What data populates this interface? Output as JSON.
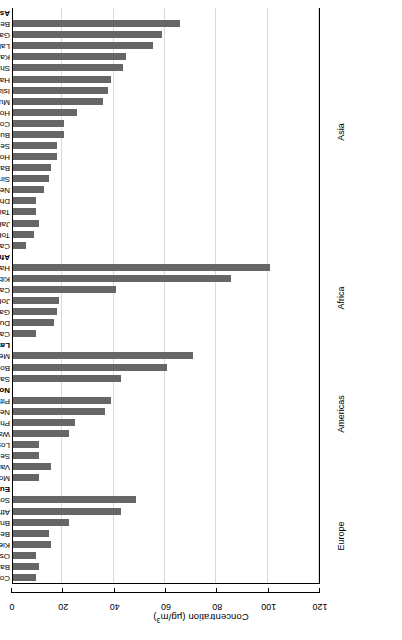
{
  "chart_data": {
    "type": "bar",
    "orientation": "horizontal",
    "title": "",
    "xlabel": "Concentration (µg/m³)",
    "ylabel": "",
    "xlim": [
      0,
      120
    ],
    "xticks": [
      0,
      20,
      40,
      60,
      80,
      100,
      120
    ],
    "xtick_labels": [
      "0",
      "20",
      "40",
      "60",
      "80",
      "100",
      "120"
    ],
    "grid": "vertical",
    "legend": "none",
    "bar_color": "#666666",
    "axis_color": "#000000",
    "gridline_color": "#d9d9d9",
    "rotated_180": true,
    "categories": [
      "Asia",
      "Beijing",
      "Gangzhou",
      "Lahore",
      "Karachi",
      "Shanghai",
      "Hanoi",
      "Islamabad",
      "Mumbai",
      "Ho Chi Minh City",
      "Colombo",
      "Busan",
      "Seoul",
      "Hong Kong",
      "Bangkok",
      "Singapore",
      "New Delhi",
      "Dhaka",
      "Taipei",
      "Jakarta",
      "Tokyo",
      "Calcutta",
      "Africa",
      "Harare",
      "Kibwe",
      "Cairo",
      "Johannesburg",
      "Gaborone",
      "Durban",
      "Cape Town",
      "Latin America",
      "Mexico City",
      "Bogotá",
      "Sao Paulo",
      "North America",
      "Pittsburg",
      "New York",
      "Philadelphia",
      "Washington, DC",
      "Los Angles",
      "Seattle",
      "Vancouver",
      "Montreal",
      "Europe",
      "Sofia",
      "Athens",
      "Brussels",
      "Berlin",
      "Kiel",
      "Oslo",
      "Barcelona",
      "Copenhagen"
    ],
    "values": [
      null,
      65,
      58,
      54.5,
      44,
      43,
      38,
      37,
      35,
      25,
      20,
      20,
      17,
      17,
      15,
      14,
      12,
      9,
      9,
      10,
      8,
      5,
      null,
      100,
      85,
      40,
      18,
      17,
      16,
      9,
      null,
      70,
      60,
      42,
      null,
      38,
      36,
      24,
      22,
      10,
      10,
      15,
      10,
      null,
      48,
      42,
      22,
      14,
      15,
      9,
      10,
      9
    ],
    "group_labels": [
      "Asia",
      "Africa",
      "Latin America",
      "North America",
      "Europe"
    ],
    "regions": [
      {
        "name": "Asia"
      },
      {
        "name": "Africa"
      },
      {
        "name": "Americas"
      },
      {
        "name": "Europe"
      }
    ]
  },
  "axis": {
    "title_main": "Concentration (µg/m",
    "title_sup": "3",
    "title_close": ")"
  }
}
